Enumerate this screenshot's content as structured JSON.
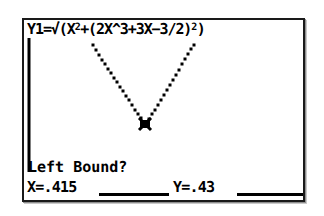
{
  "device": {
    "kind": "graphing-calculator-screen"
  },
  "screen": {
    "equation": {
      "prefix": "Y1=∫(X",
      "label_plain": "Y1=√(X²+(2X^3+3X-3/2)²)",
      "token_y1": "Y1",
      "token_equals": "=",
      "token_radical": "√",
      "token_open1": "(",
      "token_x": "X",
      "token_sq1": "2",
      "token_plus1": "+",
      "token_open2": "(",
      "token_2x": "2X^3",
      "token_plus2": "+",
      "token_3x": "3X",
      "token_minus": "−",
      "token_frac": "3/2",
      "token_close2": ")",
      "token_sq2": "2",
      "token_close1": ")"
    },
    "prompt": "Left Bound?",
    "x_readout": "X=.415",
    "y_readout": "Y=.43",
    "colors": {
      "ink": "#000000",
      "lcd_background": "#ffffff",
      "frame": "#1a1a1a",
      "frame_shadow": "#8f8f8f"
    }
  },
  "chart_data": {
    "type": "line",
    "xlabel": "",
    "ylabel": "",
    "grid": false,
    "legend": null,
    "style": "dotted-pixel-plot",
    "cursor": {
      "label": "Left Bound?",
      "x": 0.415,
      "y": 0.43,
      "pixel": [
        143,
        124
      ]
    },
    "axes": {
      "y_axis_pixel_x": 27,
      "y_axis_pixel_y0": 36,
      "y_axis_pixel_y1": 170,
      "x_axis_visible": false
    },
    "points": [
      [
        91,
        45
      ],
      [
        94,
        50
      ],
      [
        97,
        55
      ],
      [
        100,
        60
      ],
      [
        103,
        64
      ],
      [
        106,
        69
      ],
      [
        109,
        73
      ],
      [
        112,
        78
      ],
      [
        115,
        82
      ],
      [
        118,
        87
      ],
      [
        121,
        91
      ],
      [
        124,
        96
      ],
      [
        127,
        100
      ],
      [
        130,
        105
      ],
      [
        133,
        110
      ],
      [
        136,
        114
      ],
      [
        139,
        118
      ],
      [
        143,
        124
      ],
      [
        147,
        119
      ],
      [
        150,
        114
      ],
      [
        153,
        110
      ],
      [
        156,
        105
      ],
      [
        159,
        100
      ],
      [
        162,
        95
      ],
      [
        165,
        90
      ],
      [
        168,
        85
      ],
      [
        171,
        80
      ],
      [
        174,
        75
      ],
      [
        177,
        70
      ],
      [
        180,
        64
      ],
      [
        183,
        59
      ],
      [
        186,
        54
      ],
      [
        189,
        49
      ],
      [
        192,
        45
      ]
    ]
  }
}
